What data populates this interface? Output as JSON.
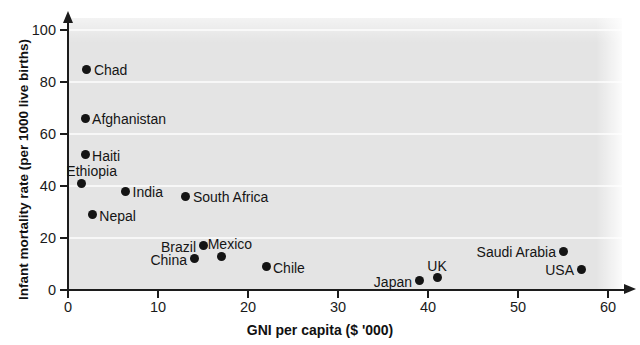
{
  "chart_data": {
    "type": "scatter",
    "title": "",
    "xlabel": "GNI per capita ($ '000)",
    "ylabel": "Infant mortality rate (per 1000 live births)",
    "xlim": [
      0,
      60
    ],
    "ylim": [
      0,
      105
    ],
    "xticks": [
      "0",
      "10",
      "20",
      "30",
      "40",
      "50",
      "60"
    ],
    "xtick_values": [
      0,
      10,
      20,
      30,
      40,
      50,
      60
    ],
    "yticks": [
      "0",
      "20",
      "40",
      "60",
      "80",
      "100"
    ],
    "ytick_values": [
      0,
      20,
      40,
      60,
      80,
      100
    ],
    "grid": "horizontal",
    "legend": "none",
    "plot_background": "#e4e4e4",
    "gridline_color": "#f7f7f7",
    "marker_color": "#141414",
    "points": [
      {
        "label": "Chad",
        "x": 2.1,
        "y": 85.0,
        "label_pos": "right"
      },
      {
        "label": "Afghanistan",
        "x": 1.9,
        "y": 66.0,
        "label_pos": "right"
      },
      {
        "label": "Haiti",
        "x": 1.9,
        "y": 52.0,
        "label_pos": "right"
      },
      {
        "label": "Ethiopia",
        "x": 1.5,
        "y": 41.0,
        "label_pos": "above-right"
      },
      {
        "label": "India",
        "x": 6.4,
        "y": 38.0,
        "label_pos": "right"
      },
      {
        "label": "Nepal",
        "x": 2.7,
        "y": 29.0,
        "label_pos": "right"
      },
      {
        "label": "South Africa",
        "x": 13.1,
        "y": 36.0,
        "label_pos": "right"
      },
      {
        "label": "Brazil",
        "x": 15.0,
        "y": 17.0,
        "label_pos": "left"
      },
      {
        "label": "China",
        "x": 14.0,
        "y": 12.0,
        "label_pos": "left"
      },
      {
        "label": "Mexico",
        "x": 17.0,
        "y": 13.0,
        "label_pos": "above-right"
      },
      {
        "label": "Chile",
        "x": 22.0,
        "y": 9.0,
        "label_pos": "right"
      },
      {
        "label": "Japan",
        "x": 39.0,
        "y": 3.5,
        "label_pos": "left"
      },
      {
        "label": "UK",
        "x": 41.0,
        "y": 5.0,
        "label_pos": "above"
      },
      {
        "label": "Saudi Arabia",
        "x": 55.0,
        "y": 15.0,
        "label_pos": "left"
      },
      {
        "label": "USA",
        "x": 57.0,
        "y": 8.0,
        "label_pos": "left"
      }
    ]
  }
}
